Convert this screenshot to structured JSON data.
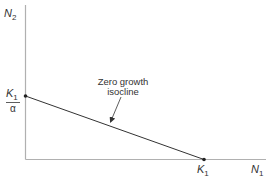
{
  "diagram": {
    "type": "phase-plane isocline",
    "y_axis_label": {
      "main": "N",
      "sub": "2"
    },
    "x_axis_label": {
      "main": "N",
      "sub": "1"
    },
    "y_intercept_label": {
      "numerator_main": "K",
      "numerator_sub": "1",
      "denominator": "α"
    },
    "x_intercept_label": {
      "main": "K",
      "sub": "1"
    },
    "annotation": {
      "line1": "Zero growth",
      "line2": "isocline"
    },
    "colors": {
      "axis": "#b0b0b0",
      "line": "#333333",
      "text": "#333333"
    }
  }
}
